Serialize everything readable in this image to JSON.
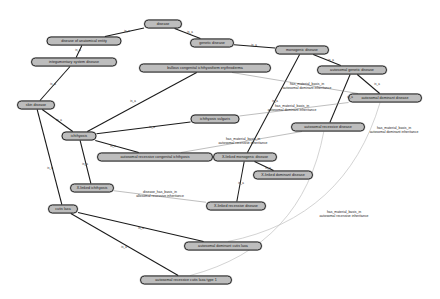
{
  "graph": {
    "title": "Disease ontology subgraph",
    "background_color": "#ffffff",
    "node_fill": "#bdbdbd",
    "node_border": "#2a2a2a",
    "edge_color": "#1a1a1a",
    "faint_edge_color": "#b5b5b5",
    "nodes": [
      {
        "id": "disease",
        "label": "disease",
        "x": 163,
        "y": 24,
        "w": 38,
        "h": 9
      },
      {
        "id": "doae",
        "label": "disease of anatomical entity",
        "x": 84,
        "y": 41,
        "w": 75,
        "h": 9
      },
      {
        "id": "genetic",
        "label": "genetic disease",
        "x": 212,
        "y": 43,
        "w": 44,
        "h": 9
      },
      {
        "id": "monogenic",
        "label": "monogenic disease",
        "x": 302,
        "y": 50,
        "w": 54,
        "h": 9
      },
      {
        "id": "integ",
        "label": "integumentary system disease",
        "x": 74,
        "y": 62,
        "w": 86,
        "h": 9
      },
      {
        "id": "bullous",
        "label": "bullous congenital ichthyosiform erythroderma",
        "x": 205,
        "y": 68,
        "w": 132,
        "h": 9
      },
      {
        "id": "autogenetic",
        "label": "autosomal genetic disease",
        "x": 352,
        "y": 70,
        "w": 70,
        "h": 9
      },
      {
        "id": "autodom",
        "label": "autosomal dominant disease",
        "x": 385,
        "y": 98,
        "w": 74,
        "h": 9
      },
      {
        "id": "skin",
        "label": "skin disease",
        "x": 36,
        "y": 105,
        "w": 38,
        "h": 9
      },
      {
        "id": "ichthvulg",
        "label": "ichthyosis vulgaris",
        "x": 215,
        "y": 119,
        "w": 49,
        "h": 9
      },
      {
        "id": "autorec",
        "label": "autosomal recessive disease",
        "x": 328,
        "y": 127,
        "w": 74,
        "h": 9
      },
      {
        "id": "ichthyosis",
        "label": "ichthyosis",
        "x": 79,
        "y": 136,
        "w": 35,
        "h": 9
      },
      {
        "id": "arci",
        "label": "autosomal recessive congenital ichthyosis",
        "x": 155,
        "y": 157,
        "w": 116,
        "h": 9
      },
      {
        "id": "xmono",
        "label": "X-linked monogenic disease",
        "x": 245,
        "y": 157,
        "w": 64,
        "h": 9
      },
      {
        "id": "xdom",
        "label": "X-linked dominant disease",
        "x": 283,
        "y": 175,
        "w": 60,
        "h": 9
      },
      {
        "id": "xichth",
        "label": "X-linked ichthyosis",
        "x": 92,
        "y": 188,
        "w": 44,
        "h": 9
      },
      {
        "id": "xrec",
        "label": "X-linked recessive disease",
        "x": 236,
        "y": 206,
        "w": 60,
        "h": 9
      },
      {
        "id": "cutislaxa",
        "label": "cutis laxa",
        "x": 63,
        "y": 209,
        "w": 30,
        "h": 9
      },
      {
        "id": "adcl",
        "label": "autosomal dominant cutis laxa",
        "x": 223,
        "y": 246,
        "w": 78,
        "h": 9
      },
      {
        "id": "arcl1",
        "label": "autosomal recessive cutis laxa type 1",
        "x": 186,
        "y": 280,
        "w": 92,
        "h": 9
      }
    ],
    "edges": [
      {
        "from": "disease",
        "to": "doae",
        "label": "is_a"
      },
      {
        "from": "disease",
        "to": "genetic",
        "label": "is_a"
      },
      {
        "from": "genetic",
        "to": "monogenic",
        "label": "is_a"
      },
      {
        "from": "doae",
        "to": "integ",
        "label": "is_a"
      },
      {
        "from": "integ",
        "to": "skin",
        "label": "is_a"
      },
      {
        "from": "skin",
        "to": "ichthyosis",
        "label": "is_a"
      },
      {
        "from": "monogenic",
        "to": "autogenetic",
        "label": "is_a"
      },
      {
        "from": "autogenetic",
        "to": "autodom",
        "label": "is_a"
      },
      {
        "from": "autogenetic",
        "to": "autorec",
        "label": "is_a"
      },
      {
        "from": "bullous",
        "to": "ichthyosis",
        "label": "is_a"
      },
      {
        "from": "ichthyosis",
        "to": "ichthvulg",
        "label": "is_a"
      },
      {
        "from": "ichthyosis",
        "to": "arci",
        "label": "is_a"
      },
      {
        "from": "ichthyosis",
        "to": "xichth",
        "label": "is_a"
      },
      {
        "from": "monogenic",
        "to": "xmono",
        "label": "is_a"
      },
      {
        "from": "xmono",
        "to": "xdom",
        "label": "is_a"
      },
      {
        "from": "xmono",
        "to": "xrec",
        "label": "is_a"
      },
      {
        "from": "skin",
        "to": "cutislaxa",
        "label": "is_a"
      },
      {
        "from": "cutislaxa",
        "to": "adcl",
        "label": "is_a"
      },
      {
        "from": "cutislaxa",
        "to": "arcl1",
        "label": "is_a"
      },
      {
        "from": "bullous",
        "to": "autodom",
        "label": "has_material_basis_in autosomal dominant inheritance"
      },
      {
        "from": "ichthvulg",
        "to": "autodom",
        "label": "has_material_basis_in autosomal dominant inheritance"
      },
      {
        "from": "arci",
        "to": "autorec",
        "label": "disease_has_basis_in autosomal recessive inheritance"
      },
      {
        "from": "adcl",
        "to": "autodom",
        "label": "has_material_basis_in autosomal dominant inheritance"
      },
      {
        "from": "arcl1",
        "to": "autorec",
        "label": "has_material_basis_in autosomal recessive inheritance"
      },
      {
        "from": "xichth",
        "to": "xrec",
        "label": "disease_has_basis_in autosomal recessive inheritance"
      }
    ],
    "edge_labels": [
      {
        "id": "lbl1",
        "line1": "has_material_basis_in",
        "line2": "autosomal dominant inheritance",
        "x": 307,
        "y": 86
      },
      {
        "id": "lbl2",
        "line1": "has_material_basis_in",
        "line2": "autosomal dominant inheritance",
        "x": 292,
        "y": 108
      },
      {
        "id": "lbl3",
        "line1": "has_material_basis_in",
        "line2": "autosomal dominant inheritance",
        "x": 394,
        "y": 130
      },
      {
        "id": "lbl4",
        "line1": "has_material_basis_in",
        "line2": "autosomal recessive inheritance",
        "x": 243,
        "y": 141
      },
      {
        "id": "lbl5",
        "line1": "disease_has_basis_in",
        "line2": "allosomal recessive inheritance",
        "x": 160,
        "y": 194
      },
      {
        "id": "lbl6",
        "line1": "has_material_basis_in",
        "line2": "autosomal recessive inheritance",
        "x": 344,
        "y": 214
      }
    ],
    "is_a_markers": [
      {
        "x": 127,
        "y": 31
      },
      {
        "x": 190,
        "y": 32
      },
      {
        "x": 254,
        "y": 45
      },
      {
        "x": 78,
        "y": 50
      },
      {
        "x": 53,
        "y": 84
      },
      {
        "x": 59,
        "y": 120
      },
      {
        "x": 331,
        "y": 60
      },
      {
        "x": 377,
        "y": 84
      },
      {
        "x": 350,
        "y": 97
      },
      {
        "x": 133,
        "y": 101
      },
      {
        "x": 152,
        "y": 127
      },
      {
        "x": 113,
        "y": 146
      },
      {
        "x": 85,
        "y": 164
      },
      {
        "x": 275,
        "y": 101
      },
      {
        "x": 268,
        "y": 168
      },
      {
        "x": 241,
        "y": 183
      },
      {
        "x": 50,
        "y": 168
      },
      {
        "x": 141,
        "y": 228
      },
      {
        "x": 124,
        "y": 247
      }
    ]
  }
}
